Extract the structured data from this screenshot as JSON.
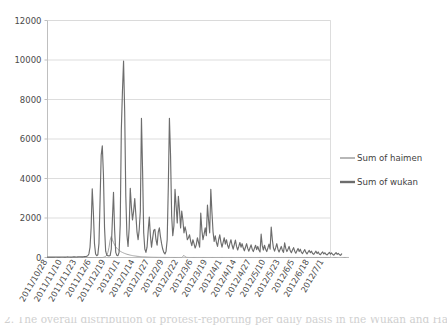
{
  "chart_data": {
    "type": "line",
    "title": "",
    "xlabel": "",
    "ylabel": "",
    "ylim": [
      0,
      12000
    ],
    "ytick_step": 2000,
    "yticks": [
      "0",
      "2000",
      "4000",
      "6000",
      "8000",
      "10000",
      "12000"
    ],
    "grid": true,
    "legend_position": "right",
    "colors": {
      "haimen": "#a6a6a6",
      "wukan": "#6d6d6d",
      "gridline": "#d9d9d9",
      "axis": "#bfbfbf",
      "background": "#ffffff",
      "text": "#4a4a4a"
    },
    "xtick_labels": [
      "2011/10/28",
      "2011/11/10",
      "2011/11/23",
      "2011/12/6",
      "2011/12/19",
      "2012/1/1",
      "2012/1/14",
      "2012/1/27",
      "2012/2/9",
      "2012/2/22",
      "2012/3/6",
      "2012/3/19",
      "2012/4/1",
      "2012/4/14",
      "2012/4/27",
      "2012/5/10",
      "2012/5/23",
      "2012/6/5",
      "2012/6/18",
      "2012/7/1"
    ],
    "xtick_interval_days": 13,
    "x_start": "2011/10/28",
    "x_end": "2012/7/1",
    "n_points": 254,
    "series": [
      {
        "name": "Sum of haimen",
        "color": "#a6a6a6",
        "values": [
          0,
          0,
          0,
          0,
          0,
          0,
          0,
          0,
          0,
          0,
          0,
          0,
          0,
          0,
          0,
          0,
          0,
          0,
          0,
          0,
          0,
          0,
          0,
          0,
          0,
          0,
          0,
          0,
          0,
          0,
          0,
          0,
          0,
          0,
          0,
          0,
          0,
          0,
          0,
          0,
          0,
          0,
          0,
          0,
          0,
          0,
          0,
          0,
          0,
          0,
          10,
          30,
          60,
          120,
          260,
          520,
          880,
          1060,
          900,
          760,
          640,
          540,
          470,
          410,
          360,
          320,
          285,
          255,
          230,
          205,
          185,
          165,
          150,
          135,
          120,
          108,
          96,
          86,
          78,
          70,
          62,
          56,
          50,
          45,
          40,
          36,
          32,
          29,
          26,
          23,
          21,
          19,
          17,
          15,
          14,
          12,
          11,
          10,
          9,
          8,
          8,
          7,
          6,
          6,
          5,
          5,
          4,
          4,
          4,
          3,
          3,
          3,
          3,
          2,
          2,
          2,
          2,
          2,
          2,
          2,
          2,
          60,
          110,
          40,
          12,
          5,
          3,
          2,
          2,
          2,
          2,
          2,
          2,
          2,
          2,
          2,
          2,
          2,
          2,
          2,
          2,
          2,
          2,
          2,
          2,
          2,
          2,
          2,
          2,
          2,
          2,
          2,
          2,
          2,
          2,
          2,
          2,
          2,
          2,
          2,
          2,
          2,
          2,
          2,
          2,
          2,
          2,
          2,
          2,
          2,
          2,
          2,
          2,
          2,
          2,
          2,
          2,
          2,
          2,
          2,
          2,
          2,
          2,
          2,
          2,
          2,
          2,
          2,
          2,
          2,
          2,
          2,
          2,
          2,
          2,
          2,
          2,
          2,
          2,
          2,
          2,
          2,
          2,
          2,
          2,
          2,
          2,
          2,
          2,
          2,
          2,
          2,
          2,
          2,
          2,
          2,
          2,
          2,
          2,
          2,
          2,
          2,
          2,
          2,
          2,
          2,
          2,
          2,
          2,
          2,
          2,
          2,
          2,
          2,
          2,
          2,
          2,
          2,
          2,
          2,
          2,
          2,
          2,
          2,
          2,
          2,
          2,
          2,
          2,
          2,
          2,
          2,
          2,
          2,
          2,
          2,
          2,
          2,
          2,
          2,
          2,
          2,
          2,
          2,
          2,
          2,
          2,
          2,
          2,
          2
        ]
      },
      {
        "name": "Sum of wukan",
        "color": "#6d6d6d",
        "values": [
          20,
          18,
          22,
          25,
          20,
          18,
          22,
          26,
          24,
          20,
          18,
          22,
          25,
          28,
          24,
          20,
          22,
          26,
          30,
          28,
          24,
          22,
          26,
          30,
          34,
          30,
          28,
          32,
          36,
          40,
          38,
          34,
          38,
          44,
          50,
          60,
          90,
          180,
          520,
          1500,
          3480,
          2300,
          700,
          180,
          90,
          140,
          700,
          2900,
          5180,
          5650,
          4200,
          1500,
          320,
          120,
          90,
          80,
          100,
          420,
          1900,
          3300,
          1400,
          260,
          110,
          95,
          260,
          1650,
          6480,
          8400,
          9950,
          7400,
          3100,
          1150,
          560,
          1480,
          3500,
          2550,
          1900,
          2350,
          2980,
          2150,
          1300,
          900,
          1420,
          2350,
          7050,
          4400,
          1250,
          430,
          260,
          520,
          1350,
          2050,
          1100,
          520,
          980,
          1380,
          1420,
          900,
          620,
          1280,
          1500,
          1050,
          700,
          430,
          260,
          180,
          320,
          900,
          3600,
          7050,
          5200,
          2100,
          1100,
          1600,
          3450,
          2600,
          1750,
          3100,
          2400,
          1500,
          2350,
          1900,
          1250,
          1550,
          1300,
          900,
          1000,
          1150,
          820,
          600,
          900,
          700,
          480,
          640,
          1000,
          760,
          520,
          2250,
          1400,
          900,
          1180,
          1500,
          1100,
          2650,
          1900,
          1250,
          3450,
          2300,
          1300,
          820,
          1100,
          760,
          560,
          900,
          1150,
          780,
          520,
          760,
          1000,
          680,
          900,
          620,
          460,
          700,
          900,
          620,
          420,
          650,
          880,
          560,
          380,
          560,
          760,
          520,
          700,
          480,
          340,
          520,
          700,
          460,
          320,
          480,
          640,
          420,
          300,
          460,
          620,
          400,
          560,
          380,
          280,
          1180,
          600,
          380,
          620,
          420,
          300,
          480,
          680,
          420,
          1540,
          900,
          480,
          320,
          500,
          700,
          420,
          280,
          420,
          560,
          360,
          260,
          740,
          460,
          300,
          420,
          560,
          340,
          240,
          380,
          500,
          320,
          220,
          340,
          460,
          300,
          420,
          260,
          200,
          300,
          400,
          260,
          180,
          280,
          360,
          240,
          320,
          200,
          160,
          240,
          320,
          200,
          280,
          180,
          140,
          220,
          280,
          180,
          240,
          160,
          130,
          200,
          260,
          170,
          230,
          150,
          120,
          190,
          250,
          160,
          210,
          140,
          110,
          180
        ]
      }
    ]
  },
  "legend": {
    "items": [
      {
        "label": "Sum of haimen",
        "color": "#a6a6a6",
        "thickness": 1.6
      },
      {
        "label": "Sum of wukan",
        "color": "#6d6d6d",
        "thickness": 2.4
      }
    ]
  },
  "caption": {
    "text": "2.    The overall distribution of protest-reporting per daily basis in the Wukan and Haimen"
  }
}
